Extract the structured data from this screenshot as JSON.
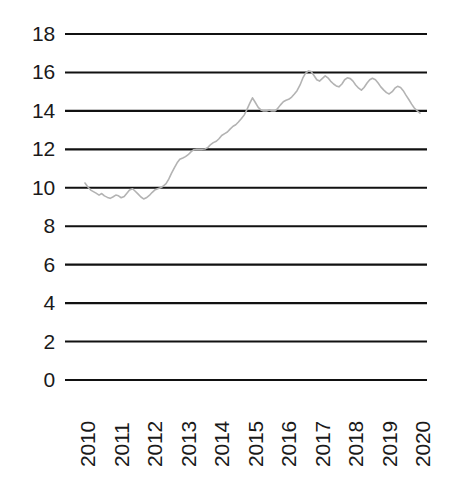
{
  "chart_data": {
    "type": "line",
    "title": "",
    "subtitle": "",
    "xlabel": "",
    "ylabel": "",
    "xlim": [
      2010,
      2020
    ],
    "ylim": [
      0,
      18
    ],
    "grid": true,
    "legend": false,
    "legend_position": "none",
    "y_ticks": [
      18,
      16,
      14,
      12,
      10,
      8,
      6,
      4,
      2,
      0
    ],
    "y_tick_labels": [
      "18",
      "16",
      "14",
      "12",
      "10",
      "8",
      "6",
      "4",
      "2",
      "0"
    ],
    "x_ticks": [
      2010,
      2011,
      2012,
      2013,
      2014,
      2015,
      2016,
      2017,
      2018,
      2019,
      2020
    ],
    "x_tick_labels": [
      "2010",
      "2011",
      "2012",
      "2013",
      "2014",
      "2015",
      "2016",
      "2017",
      "2018",
      "2019",
      "2020"
    ],
    "line_color": "#b3b3b3",
    "grid_color": "#111111",
    "series": [
      {
        "name": "series-1",
        "x": [
          2010.0,
          2010.08,
          2010.17,
          2010.25,
          2010.33,
          2010.42,
          2010.5,
          2010.58,
          2010.67,
          2010.75,
          2010.83,
          2010.92,
          2011.0,
          2011.08,
          2011.17,
          2011.25,
          2011.33,
          2011.42,
          2011.5,
          2011.58,
          2011.67,
          2011.75,
          2011.83,
          2011.92,
          2012.0,
          2012.08,
          2012.17,
          2012.25,
          2012.33,
          2012.42,
          2012.5,
          2012.58,
          2012.67,
          2012.75,
          2012.83,
          2012.92,
          2013.0,
          2013.08,
          2013.17,
          2013.25,
          2013.33,
          2013.42,
          2013.5,
          2013.58,
          2013.67,
          2013.75,
          2013.83,
          2013.92,
          2014.0,
          2014.08,
          2014.17,
          2014.25,
          2014.33,
          2014.42,
          2014.5,
          2014.58,
          2014.67,
          2014.75,
          2014.83,
          2014.92,
          2015.0,
          2015.08,
          2015.17,
          2015.25,
          2015.33,
          2015.42,
          2015.5,
          2015.58,
          2015.67,
          2015.75,
          2015.83,
          2015.92,
          2016.0,
          2016.08,
          2016.17,
          2016.25,
          2016.33,
          2016.42,
          2016.5,
          2016.58,
          2016.67,
          2016.75,
          2016.83,
          2016.92,
          2017.0,
          2017.08,
          2017.17,
          2017.25,
          2017.33,
          2017.42,
          2017.5,
          2017.58,
          2017.67,
          2017.75,
          2017.83,
          2017.92,
          2018.0,
          2018.08,
          2018.17,
          2018.25,
          2018.33,
          2018.42,
          2018.5,
          2018.58,
          2018.67,
          2018.75,
          2018.83,
          2018.92,
          2019.0,
          2019.08,
          2019.17,
          2019.25,
          2019.33,
          2019.42,
          2019.5,
          2019.58,
          2019.67,
          2019.75,
          2019.83,
          2019.92,
          2020.0
        ],
        "values": [
          10.25,
          10.05,
          9.88,
          9.8,
          9.72,
          9.62,
          9.7,
          9.58,
          9.5,
          9.45,
          9.52,
          9.62,
          9.58,
          9.48,
          9.55,
          9.72,
          9.88,
          9.95,
          9.82,
          9.68,
          9.52,
          9.42,
          9.48,
          9.6,
          9.75,
          9.88,
          9.95,
          10.0,
          10.08,
          10.22,
          10.45,
          10.75,
          11.05,
          11.3,
          11.48,
          11.55,
          11.62,
          11.72,
          11.88,
          11.98,
          12.0,
          12.0,
          12.0,
          12.02,
          12.1,
          12.25,
          12.35,
          12.42,
          12.55,
          12.72,
          12.82,
          12.9,
          13.05,
          13.2,
          13.28,
          13.42,
          13.6,
          13.78,
          14.05,
          14.4,
          14.68,
          14.45,
          14.18,
          14.05,
          14.0,
          14.0,
          14.05,
          14.0,
          14.0,
          14.12,
          14.3,
          14.48,
          14.55,
          14.6,
          14.72,
          14.88,
          15.05,
          15.35,
          15.7,
          15.95,
          16.08,
          16.05,
          15.85,
          15.62,
          15.55,
          15.68,
          15.82,
          15.72,
          15.55,
          15.4,
          15.3,
          15.25,
          15.4,
          15.62,
          15.72,
          15.68,
          15.55,
          15.35,
          15.18,
          15.08,
          15.22,
          15.45,
          15.62,
          15.7,
          15.62,
          15.45,
          15.25,
          15.08,
          14.95,
          14.88,
          15.0,
          15.18,
          15.28,
          15.22,
          15.05,
          14.82,
          14.58,
          14.35,
          14.15,
          14.0,
          13.88
        ]
      }
    ]
  },
  "layout": {
    "plot_left": 65,
    "plot_right": 427,
    "y_top_value": 18,
    "y_top_px": 34,
    "y_bottom_value": 0,
    "y_bottom_px": 380,
    "x_first_px": 85,
    "x_last_px": 420
  }
}
